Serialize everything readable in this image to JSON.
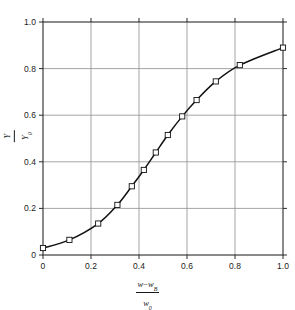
{
  "figure": {
    "background_color": "#ffffff",
    "frame_color": "#2b2b2b",
    "grid_color": "#9a9a9a",
    "curve_color": "#111111",
    "marker_face_color": "#ffffff"
  },
  "axis_labels": {
    "x": {
      "numerator_var": "w",
      "numerator_minus": "−",
      "numerator_var2": "w",
      "numerator_sub2": "B",
      "denominator_var": "w",
      "denominator_sub": "0"
    },
    "y": {
      "numerator_var": "Y",
      "denominator_var": "Y",
      "denominator_sub": "0"
    }
  },
  "chart_data": {
    "type": "line",
    "title": "",
    "xlabel": "(w - w_B) / w_0",
    "ylabel": "Y / Y_0",
    "xlim": [
      0,
      1.0
    ],
    "ylim": [
      0,
      1.0
    ],
    "grid": true,
    "legend": "none",
    "xticks": [
      0,
      0.2,
      0.4,
      0.6,
      0.8,
      1.0
    ],
    "yticks": [
      0,
      0.2,
      0.4,
      0.6,
      0.8,
      1.0
    ],
    "xtick_labels": [
      "0",
      "0.2",
      "0.4",
      "0.6",
      "0.8",
      "1.0"
    ],
    "ytick_labels": [
      "0",
      "0.2",
      "0.4",
      "0.6",
      "0.8",
      "1.0"
    ],
    "marker": "open-square",
    "series": [
      {
        "name": "Y/Y0 vs (w-wB)/w0",
        "x": [
          0.0,
          0.11,
          0.23,
          0.31,
          0.37,
          0.42,
          0.47,
          0.52,
          0.58,
          0.64,
          0.72,
          0.82,
          1.0
        ],
        "y": [
          0.03,
          0.065,
          0.135,
          0.215,
          0.295,
          0.365,
          0.44,
          0.515,
          0.595,
          0.665,
          0.745,
          0.815,
          0.89
        ]
      }
    ]
  }
}
